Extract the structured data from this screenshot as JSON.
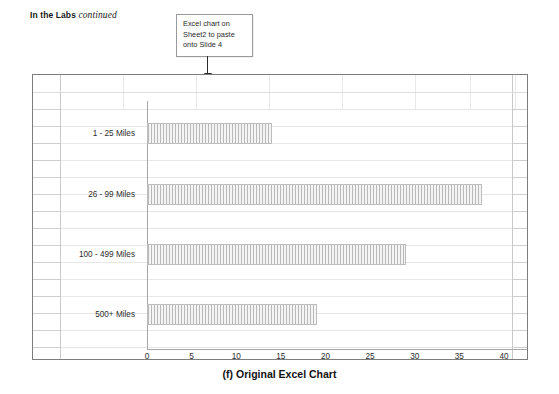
{
  "running_head": {
    "bold_text": "In the Labs",
    "italic_text": "continued"
  },
  "callout": {
    "text": "Excel chart on Sheet2 to paste onto Slide 4",
    "arrow": "down-arrow-icon"
  },
  "caption": "(f) Original Excel Chart",
  "colors": {
    "sheet_border": "#7d7d7d",
    "grid_line": "#e6e6e6",
    "axis_line": "#a6a6a6",
    "bar_fill": "#b9b9b9",
    "callout_border": "#9a9a9a"
  },
  "sheet": {
    "grid_columns_x": [
      27,
      90,
      163,
      236,
      309,
      382,
      437,
      482
    ],
    "grid_row_height": 17,
    "edge_row_height": 17
  },
  "chart_data": {
    "type": "bar",
    "orientation": "horizontal",
    "title": "",
    "xlabel": "",
    "ylabel": "",
    "categories": [
      "1 - 25 Miles",
      "26 - 99 Miles",
      "100 - 499 Miles",
      "500+ Miles"
    ],
    "values": [
      14,
      37.5,
      29,
      19
    ],
    "xlim": [
      0,
      40
    ],
    "xticks": [
      0,
      5,
      10,
      15,
      20,
      25,
      30,
      35,
      40
    ],
    "xtick_labels": [
      "0",
      "5",
      "10",
      "15",
      "20",
      "25",
      "30",
      "35",
      "40"
    ],
    "grid": false,
    "legend": false,
    "series": [
      {
        "name": "Series 1",
        "values": [
          14,
          37.5,
          29,
          19
        ]
      }
    ]
  }
}
